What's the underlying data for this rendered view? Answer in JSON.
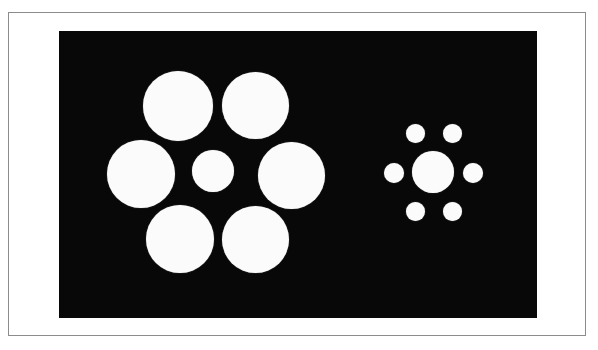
{
  "figure": {
    "canvas": {
      "width": 598,
      "height": 350
    },
    "colors": {
      "page_background": "#ffffff",
      "plate_border": "#8c8c8c",
      "panel_background": "#080808",
      "disc_fill": "#fbfbfb"
    },
    "plate": {
      "x": 8,
      "y": 12,
      "width": 578,
      "height": 324,
      "border_width": 1
    },
    "panel": {
      "x": 59,
      "y": 31,
      "width": 478,
      "height": 287
    }
  },
  "chart_data": {
    "type": "scatter",
    "xlabel": "",
    "ylabel": "",
    "xlim": [
      59,
      537
    ],
    "ylim": [
      31,
      318
    ],
    "grid": false,
    "legend": "none",
    "units": "pixels",
    "annotations": [
      "Both central discs have an identical diameter of 42 px.",
      "Left surround discs: 67 px diameter (large inducers).",
      "Right surround discs: 19 px diameter (small inducers)."
    ],
    "series": [
      {
        "name": "left-cluster-center",
        "role": "target-disc",
        "diameter": 42,
        "points": [
          {
            "label": "left-center",
            "cx": 213,
            "cy": 171,
            "d": 42
          }
        ]
      },
      {
        "name": "left-cluster-surrounds",
        "role": "large-inducers",
        "diameter": 67,
        "points": [
          {
            "label": "left-surround-top-left",
            "cx": 178,
            "cy": 106,
            "d": 70
          },
          {
            "label": "left-surround-top-right",
            "cx": 255,
            "cy": 105,
            "d": 67
          },
          {
            "label": "left-surround-left",
            "cx": 141,
            "cy": 174,
            "d": 68
          },
          {
            "label": "left-surround-right",
            "cx": 291,
            "cy": 175,
            "d": 67
          },
          {
            "label": "left-surround-bottom-left",
            "cx": 180,
            "cy": 239,
            "d": 68
          },
          {
            "label": "left-surround-bottom-right",
            "cx": 255,
            "cy": 239,
            "d": 67
          }
        ]
      },
      {
        "name": "right-cluster-center",
        "role": "target-disc",
        "diameter": 42,
        "points": [
          {
            "label": "right-center",
            "cx": 433,
            "cy": 172,
            "d": 42
          }
        ]
      },
      {
        "name": "right-cluster-surrounds",
        "role": "small-inducers",
        "diameter": 19,
        "points": [
          {
            "label": "right-surround-top-left",
            "cx": 415,
            "cy": 133,
            "d": 19
          },
          {
            "label": "right-surround-top-right",
            "cx": 452,
            "cy": 133,
            "d": 19
          },
          {
            "label": "right-surround-left",
            "cx": 394,
            "cy": 173,
            "d": 20
          },
          {
            "label": "right-surround-right",
            "cx": 473,
            "cy": 173,
            "d": 20
          },
          {
            "label": "right-surround-bottom-left",
            "cx": 415,
            "cy": 211,
            "d": 19
          },
          {
            "label": "right-surround-bottom-right",
            "cx": 452,
            "cy": 211,
            "d": 19
          }
        ]
      }
    ]
  }
}
